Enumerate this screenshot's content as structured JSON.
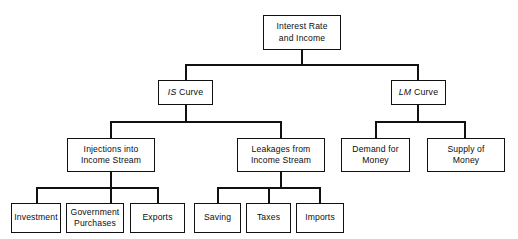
{
  "diagram": {
    "type": "tree-hierarchy",
    "colors": {
      "background": "#ffffff",
      "box_border": "#111111",
      "box_fill": "#ffffff",
      "connector": "#111111",
      "text": "#0d0d0d"
    },
    "levels": [
      {
        "level": 1,
        "nodes": [
          {
            "id": "root",
            "label": "Interest Rate\nand Income",
            "italic_prefix": ""
          }
        ]
      },
      {
        "level": 2,
        "nodes": [
          {
            "id": "is-curve",
            "italic_prefix": "IS",
            "rest": " Curve",
            "label": "IS Curve"
          },
          {
            "id": "lm-curve",
            "italic_prefix": "LM",
            "rest": " Curve",
            "label": "LM Curve"
          }
        ]
      },
      {
        "level": 3,
        "nodes": [
          {
            "id": "injections",
            "label": "Injections into\nIncome Stream"
          },
          {
            "id": "leakages",
            "label": "Leakages from\nIncome Stream"
          },
          {
            "id": "demand-money",
            "label": "Demand for\nMoney"
          },
          {
            "id": "supply-money",
            "label": "Supply of\nMoney"
          }
        ]
      },
      {
        "level": 4,
        "nodes": [
          {
            "id": "investment",
            "label": "Investment"
          },
          {
            "id": "government-purchases",
            "label": "Government\nPurchases"
          },
          {
            "id": "exports",
            "label": "Exports"
          },
          {
            "id": "saving",
            "label": "Saving"
          },
          {
            "id": "taxes",
            "label": "Taxes"
          },
          {
            "id": "imports",
            "label": "Imports"
          }
        ]
      }
    ],
    "edges": [
      {
        "from": "root",
        "to": "is-curve"
      },
      {
        "from": "root",
        "to": "lm-curve"
      },
      {
        "from": "is-curve",
        "to": "injections"
      },
      {
        "from": "is-curve",
        "to": "leakages"
      },
      {
        "from": "lm-curve",
        "to": "demand-money"
      },
      {
        "from": "lm-curve",
        "to": "supply-money"
      },
      {
        "from": "injections",
        "to": "investment"
      },
      {
        "from": "injections",
        "to": "government-purchases"
      },
      {
        "from": "injections",
        "to": "exports"
      },
      {
        "from": "leakages",
        "to": "saving"
      },
      {
        "from": "leakages",
        "to": "taxes"
      },
      {
        "from": "leakages",
        "to": "imports"
      }
    ]
  }
}
